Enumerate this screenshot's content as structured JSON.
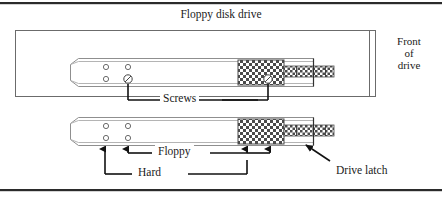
{
  "figure": {
    "title": "Floppy disk drive",
    "side_note": {
      "line1": "Front",
      "line2": "of",
      "line3": "drive"
    },
    "callouts": {
      "screws": "Screws",
      "floppy": "Floppy",
      "hard": "Hard",
      "drive_latch": "Drive latch"
    },
    "colors": {
      "ink": "#1a1a1a",
      "rule": "#2b2b2b",
      "outline": "#555555",
      "rail_edge": "#8a8a8a",
      "hatch": "#3a3a3a",
      "paper": "#ffffff"
    },
    "parts": {
      "upper_rail": "upper-drive-rail",
      "lower_rail": "lower-drive-rail",
      "screw_holes_per_rail": 4,
      "latch_region": "cross-hatched-latch"
    }
  }
}
